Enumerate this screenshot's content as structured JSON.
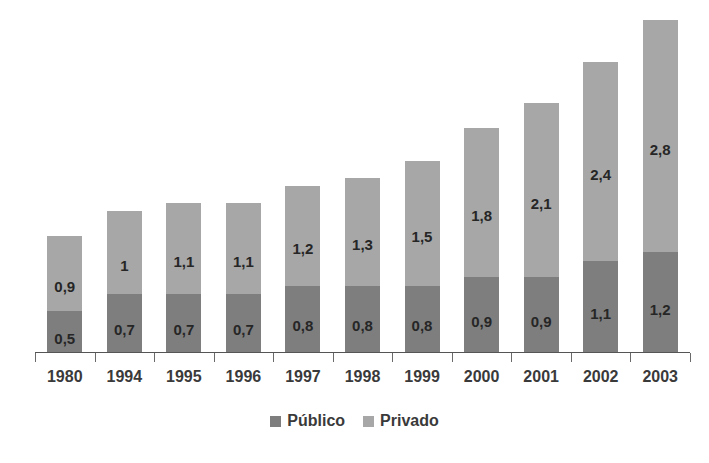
{
  "chart_data": {
    "type": "bar",
    "stacked": true,
    "title": "",
    "subtitle": "",
    "xlabel": "",
    "ylabel": "",
    "grid": false,
    "axis": {
      "y_visible": false,
      "x_visible": true,
      "ylim": [
        0,
        4
      ]
    },
    "legend": {
      "position": "bottom",
      "entries": [
        "Público",
        "Privado"
      ]
    },
    "categories": [
      "1980",
      "1994",
      "1995",
      "1996",
      "1997",
      "1998",
      "1999",
      "2000",
      "2001",
      "2002",
      "2003"
    ],
    "series": [
      {
        "name": "Público",
        "color": "#7e7e7e",
        "values": [
          0.5,
          0.7,
          0.7,
          0.7,
          0.8,
          0.8,
          0.8,
          0.9,
          0.9,
          1.1,
          1.2
        ],
        "labels": [
          "0,5",
          "0,7",
          "0,7",
          "0,7",
          "0,8",
          "0,8",
          "0,8",
          "0,9",
          "0,9",
          "1,1",
          "1,2"
        ]
      },
      {
        "name": "Privado",
        "color": "#a7a7a7",
        "values": [
          0.9,
          1.0,
          1.1,
          1.1,
          1.2,
          1.3,
          1.5,
          1.8,
          2.1,
          2.4,
          2.8
        ],
        "labels": [
          "0,9",
          "1",
          "1,1",
          "1,1",
          "1,2",
          "1,3",
          "1,5",
          "1,8",
          "2,1",
          "2,4",
          "2,8"
        ]
      }
    ],
    "totals": [
      1.4,
      1.7,
      1.8,
      1.8,
      2.0,
      2.1,
      2.3,
      2.7,
      3.0,
      3.5,
      4.0
    ]
  },
  "legend": {
    "publico": {
      "label": "Público",
      "color": "#7e7e7e"
    },
    "privado": {
      "label": "Privado",
      "color": "#a7a7a7"
    }
  },
  "colors": {
    "background": "#ffffff",
    "publico": "#7e7e7e",
    "privado": "#a7a7a7",
    "axis": "#555555",
    "label_text": "#3a3a3a",
    "value_text": "#262626"
  }
}
